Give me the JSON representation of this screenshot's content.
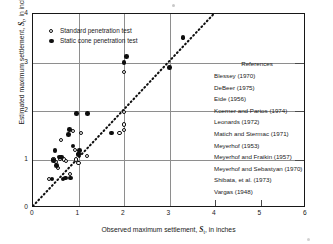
{
  "chart_data": {
    "type": "scatter",
    "title": "",
    "xlabel": "Observed maximum settlement, S, in inches",
    "ylabel": "Estimated maximum settlement, S, in inches",
    "xlabel_symbol": "S",
    "xlabel_subscript": "t",
    "ylabel_symbol": "S",
    "ylabel_subscript": "t",
    "xlabel_prefix": "Observed maximum settlement, ",
    "xlabel_suffix": ", in inches",
    "ylabel_prefix": "Estimated maximum settlement, ",
    "ylabel_suffix": ", in inches",
    "xlim": [
      0,
      6
    ],
    "ylim": [
      0,
      4
    ],
    "xticks": [
      "0",
      "1",
      "2",
      "3",
      "4",
      "5",
      "6"
    ],
    "yticks": [
      "0",
      "1",
      "2",
      "3",
      "4"
    ],
    "xtick_values": [
      0,
      1,
      2,
      3,
      4,
      5,
      6
    ],
    "ytick_values": [
      0,
      1,
      2,
      3,
      4
    ],
    "grid": "major gridlines at x=1,2,3 and y=1,2,3",
    "reference_line": {
      "label": "1:1 line of equality",
      "style": "dotted",
      "from": [
        0,
        0
      ],
      "to": [
        4,
        4
      ]
    },
    "legend_position": "upper-left inside axes",
    "series": [
      {
        "name": "Standard penetration test",
        "marker": "open-circle",
        "color": "#0d0d0d",
        "points": [
          [
            0.35,
            0.6
          ],
          [
            0.45,
            1.0
          ],
          [
            0.5,
            0.95
          ],
          [
            0.55,
            0.83
          ],
          [
            0.6,
            1.02
          ],
          [
            0.62,
            1.4
          ],
          [
            0.68,
            1.0
          ],
          [
            0.72,
            0.97
          ],
          [
            0.82,
            0.7
          ],
          [
            0.88,
            1.58
          ],
          [
            0.92,
            1.2
          ],
          [
            0.95,
            1.0
          ],
          [
            1.0,
            1.12
          ],
          [
            1.0,
            0.92
          ],
          [
            1.05,
            1.55
          ],
          [
            1.18,
            1.08
          ],
          [
            1.9,
            1.55
          ],
          [
            2.0,
            1.98
          ],
          [
            2.0,
            1.72
          ],
          [
            2.0,
            1.6
          ],
          [
            2.0,
            2.8
          ],
          [
            3.3,
            3.5
          ]
        ]
      },
      {
        "name": "Static cone penetration test",
        "marker": "filled-circle",
        "color": "#0d0d0d",
        "points": [
          [
            0.42,
            0.6
          ],
          [
            0.45,
            0.98
          ],
          [
            0.48,
            1.18
          ],
          [
            0.52,
            0.88
          ],
          [
            0.58,
            1.05
          ],
          [
            0.62,
            1.05
          ],
          [
            0.66,
            0.6
          ],
          [
            0.72,
            0.62
          ],
          [
            0.78,
            1.52
          ],
          [
            0.8,
            1.62
          ],
          [
            0.82,
            0.62
          ],
          [
            0.88,
            1.28
          ],
          [
            0.95,
            1.95
          ],
          [
            1.0,
            1.1
          ],
          [
            1.02,
            1.18
          ],
          [
            1.2,
            1.95
          ],
          [
            1.72,
            1.55
          ],
          [
            2.0,
            3.0
          ],
          [
            2.05,
            3.12
          ],
          [
            3.0,
            2.9
          ],
          [
            3.3,
            3.52
          ]
        ]
      }
    ],
    "annotations": {
      "references_title": "References",
      "references": [
        "Blessey (1970)",
        "DeBeer (1975)",
        "Eide (1956)",
        "Koerner and Partos (1974)",
        "Leonards (1972)",
        "Matich and Stermac (1971)",
        "Meyerhof (1953)",
        "Meyerhof and Fraikin (1957)",
        "Meyerhof and Sebastyan (1970)",
        "Shibata, et al. (1973)",
        "Vargas (1948)"
      ]
    }
  },
  "legend": {
    "items": [
      {
        "label": "Standard penetration test",
        "marker": "open-circle"
      },
      {
        "label": "Static cone penetration test",
        "marker": "filled-circle"
      }
    ]
  }
}
